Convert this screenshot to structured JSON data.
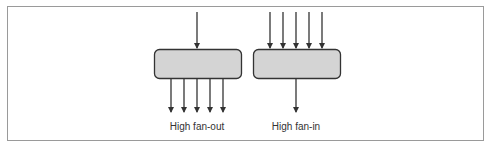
{
  "diagram": {
    "nodes": [
      {
        "id": "fan-out-module",
        "label": "High fan-out",
        "inputs": 1,
        "outputs": 5
      },
      {
        "id": "fan-in-module",
        "label": "High fan-in",
        "inputs": 5,
        "outputs": 1
      }
    ],
    "colors": {
      "box_fill": "#d4d4d4",
      "box_stroke": "#333333",
      "arrow": "#333333",
      "frame": "#9a9a9a"
    }
  }
}
